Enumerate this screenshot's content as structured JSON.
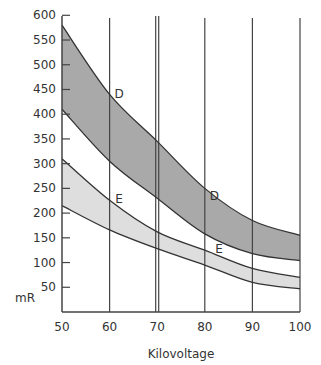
{
  "chart_data": {
    "type": "area",
    "title": "",
    "xlabel": "Kilovoltage",
    "ylabel": "mR",
    "xlim": [
      50,
      100
    ],
    "ylim": [
      0,
      600
    ],
    "x": [
      50,
      60,
      70,
      80,
      90,
      100
    ],
    "x_ticks": [
      50,
      60,
      70,
      80,
      90,
      100
    ],
    "y_ticks": [
      50,
      100,
      150,
      200,
      250,
      300,
      350,
      400,
      450,
      500,
      550,
      600
    ],
    "vertical_gridlines": [
      60,
      70,
      80,
      90,
      100
    ],
    "grid": "vertical lines only; double line at 70",
    "legend": "none; bands labeled inline",
    "series": [
      {
        "name": "D upper",
        "values": [
          580,
          440,
          345,
          250,
          185,
          155
        ]
      },
      {
        "name": "D lower",
        "values": [
          410,
          305,
          230,
          158,
          118,
          104
        ]
      },
      {
        "name": "E upper",
        "values": [
          310,
          226,
          162,
          125,
          88,
          70
        ]
      },
      {
        "name": "E lower",
        "values": [
          215,
          166,
          128,
          95,
          60,
          47
        ]
      }
    ],
    "bands": [
      {
        "name": "D",
        "upper": "D upper",
        "lower": "D lower",
        "fill": "#a9a9a9"
      },
      {
        "name": "E",
        "upper": "E upper",
        "lower": "E lower",
        "fill": "#dedede"
      }
    ],
    "annotations": [
      {
        "text": "D",
        "x": 62,
        "y": 440
      },
      {
        "text": "E",
        "x": 62,
        "y": 228
      },
      {
        "text": "D",
        "x": 82,
        "y": 235
      },
      {
        "text": "E",
        "x": 83,
        "y": 128
      }
    ]
  },
  "colors": {
    "line": "#333333",
    "axis": "#444444",
    "band_d": "#a9a9a9",
    "band_e": "#dedede"
  }
}
